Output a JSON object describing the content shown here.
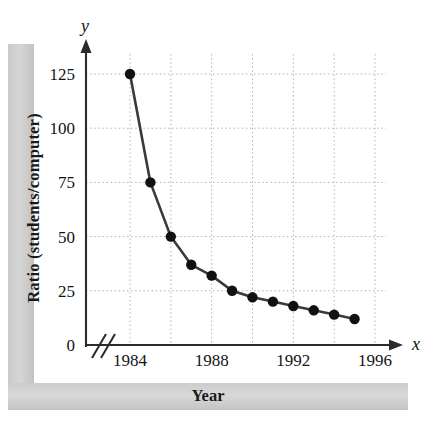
{
  "figure": {
    "y_axis_title": "Ratio (students/computer)",
    "x_axis_title": "Year",
    "x_variable_symbol": "x",
    "y_variable_symbol": "y",
    "axis_break_symbol": "//"
  },
  "chart_data": {
    "type": "line",
    "title": "",
    "xlabel": "Year",
    "ylabel": "Ratio (students/computer)",
    "x": [
      1984,
      1985,
      1986,
      1987,
      1988,
      1989,
      1990,
      1991,
      1992,
      1993,
      1994,
      1995
    ],
    "values": [
      125,
      75,
      50,
      37,
      32,
      25,
      22,
      20,
      18,
      16,
      14,
      12
    ],
    "xlim": [
      1984,
      1996
    ],
    "ylim": [
      0,
      137
    ],
    "xticks": [
      1984,
      1988,
      1992,
      1996
    ],
    "xtick_labels": [
      "1984",
      "1988",
      "1992",
      "1996"
    ],
    "yticks": [
      0,
      25,
      50,
      75,
      100,
      125
    ],
    "ytick_labels": [
      "0",
      "25",
      "50",
      "75",
      "100",
      "125"
    ],
    "x_minor_gridlines": [
      1984,
      1986,
      1988,
      1990,
      1992,
      1994,
      1996
    ],
    "grid": true,
    "legend": "none",
    "marker": "filled-circle",
    "line_color": "#3a3a3a",
    "marker_color": "#111111",
    "grid_color": "#b4b4b4",
    "axis_color": "#2b2b2b",
    "axis_break": true,
    "series_name": "Students per computer"
  }
}
